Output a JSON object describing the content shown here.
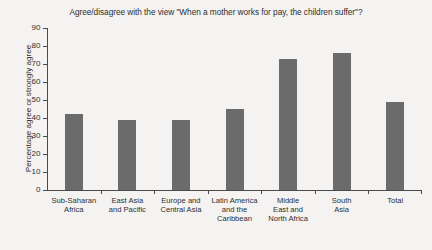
{
  "chart_data": {
    "type": "bar",
    "title": "Agree/disagree with the view \"When a mother works for pay, the children suffer\"?",
    "xlabel": "",
    "ylabel": "Percentage agree or strongly agree",
    "ylim": [
      0,
      90
    ],
    "ytick_step": 10,
    "yticks": [
      "90",
      "80",
      "70",
      "60",
      "50",
      "40",
      "30",
      "20",
      "10",
      "0"
    ],
    "grid": false,
    "legend": "none",
    "bar_color": "#6b6b6b",
    "background_color": "#f4f3f1",
    "axis_color": "#4a4a4a",
    "categories": [
      "Sub-Saharan\nAfrica",
      "East Asia\nand Pacific",
      "Europe and\nCentral Asia",
      "Latin America\nand the\nCaribbean",
      "Middle\nEast and\nNorth Africa",
      "South\nAsia",
      "Total"
    ],
    "values": [
      42,
      39,
      39,
      45,
      73,
      76,
      49
    ]
  }
}
